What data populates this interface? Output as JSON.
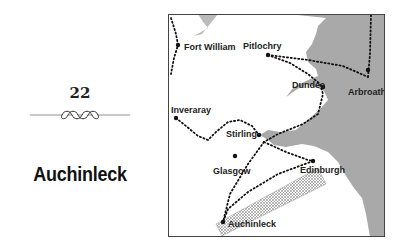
{
  "chapter": {
    "number": "22",
    "title": "Auchinleck"
  },
  "map": {
    "colors": {
      "land": "#ffffff",
      "sea": "#a9a9a9",
      "route": "#111111",
      "frame": "#444444",
      "hatch": "#888888"
    },
    "places": [
      {
        "name": "Fort William",
        "x": 10,
        "y": 31
      },
      {
        "name": "Pitlochry",
        "x": 100,
        "y": 41
      },
      {
        "name": "Arbroath",
        "x": 200,
        "y": 56
      },
      {
        "name": "Dundee",
        "x": 155,
        "y": 73
      },
      {
        "name": "Inveraray",
        "x": 8,
        "y": 104
      },
      {
        "name": "Stirling",
        "x": 91,
        "y": 121
      },
      {
        "name": "Glasgow",
        "x": 67,
        "y": 142
      },
      {
        "name": "Edinburgh",
        "x": 145,
        "y": 147
      },
      {
        "name": "Auchinleck",
        "x": 55,
        "y": 208
      }
    ]
  }
}
